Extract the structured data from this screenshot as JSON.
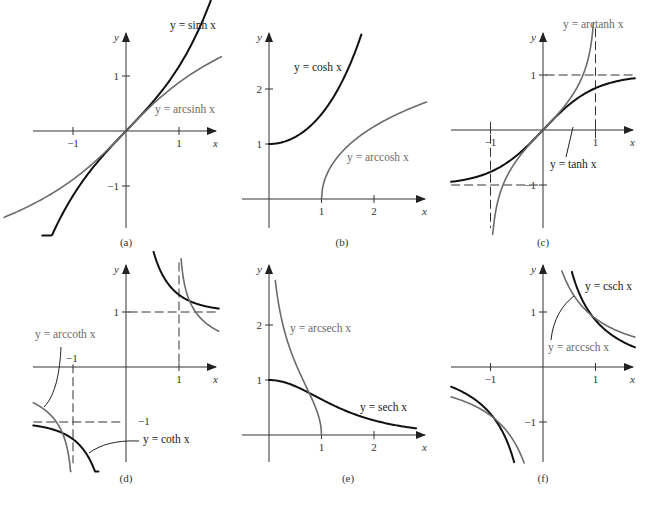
{
  "figure": {
    "panels": [
      {
        "id": "a",
        "caption": "(a)",
        "origin": [
          126,
          131
        ],
        "sx": 53,
        "sy": 55,
        "xaxis": [
          33,
          216
        ],
        "yaxis": [
          33,
          228
        ],
        "xlabel": "x",
        "ylabel": "y",
        "xticks": [
          {
            "v": -1,
            "label": "−1"
          },
          {
            "v": 1,
            "label": "1"
          }
        ],
        "yticks": [
          {
            "v": 1,
            "label": "1"
          },
          {
            "v": -1,
            "label": "−1"
          }
        ],
        "dashes": [],
        "curves": [
          {
            "name": "sinh",
            "fn": "sinh",
            "style": "fn",
            "domain": [
              -1.58,
              1.6
            ]
          },
          {
            "name": "arcsinh",
            "fn": "asinh",
            "style": "inv",
            "domain": [
              -2.3,
              1.8
            ]
          }
        ],
        "labels": [
          {
            "text": "y = sinh x",
            "x": 170,
            "y": 29,
            "style": "fn-label"
          },
          {
            "text": "y = arcsinh x",
            "x": 155,
            "y": 113,
            "style": "inv-label"
          }
        ],
        "leaders": [],
        "caption_pos": [
          126,
          246
        ]
      },
      {
        "id": "b",
        "caption": "(b)",
        "origin": [
          269,
          199
        ],
        "sx": 52.5,
        "sy": 55,
        "xaxis": [
          242,
          425
        ],
        "yaxis": [
          33,
          228
        ],
        "xlabel": "x",
        "ylabel": "y",
        "xticks": [
          {
            "v": 1,
            "label": "1"
          },
          {
            "v": 2,
            "label": "2"
          }
        ],
        "yticks": [
          {
            "v": 1,
            "label": "1"
          },
          {
            "v": 2,
            "label": "2"
          }
        ],
        "dashes": [],
        "curves": [
          {
            "name": "cosh",
            "fn": "cosh",
            "style": "fn",
            "domain": [
              0,
              1.76
            ]
          },
          {
            "name": "arccosh",
            "fn": "acosh",
            "style": "inv",
            "domain": [
              1,
              3.0
            ]
          }
        ],
        "labels": [
          {
            "text": "y = cosh x",
            "x": 294,
            "y": 71,
            "style": "fn-label"
          },
          {
            "text": "y = arccosh x",
            "x": 347,
            "y": 161,
            "style": "inv-label"
          }
        ],
        "leaders": [],
        "caption_pos": [
          342,
          246
        ]
      },
      {
        "id": "c",
        "caption": "(c)",
        "origin": [
          543,
          130
        ],
        "sx": 52.5,
        "sy": 55,
        "xaxis": [
          451,
          633
        ],
        "yaxis": [
          33,
          228
        ],
        "xlabel": "x",
        "ylabel": "y",
        "xticks": [
          {
            "v": -1,
            "label": "−1"
          },
          {
            "v": 1,
            "label": "1"
          }
        ],
        "yticks": [
          {
            "v": 1,
            "label": "1"
          },
          {
            "v": -1,
            "label": "−1"
          }
        ],
        "dashes": [
          {
            "x1": 1,
            "y1": 1.85,
            "x2": 1,
            "y2": -0.15
          },
          {
            "x1": -1,
            "y1": 0.15,
            "x2": -1,
            "y2": -1.78
          },
          {
            "x1": 0.05,
            "y1": 1,
            "x2": 1.75,
            "y2": 1
          },
          {
            "x1": -1.75,
            "y1": -1,
            "x2": -0.05,
            "y2": -1
          }
        ],
        "curves": [
          {
            "name": "tanh",
            "fn": "tanh",
            "style": "fn",
            "domain": [
              -1.75,
              1.75
            ]
          },
          {
            "name": "arctanh",
            "fn": "atanh",
            "style": "inv",
            "domain": [
              -0.96,
              0.96
            ]
          }
        ],
        "labels": [
          {
            "text": "y = arctanh x",
            "x": 563,
            "y": 28,
            "style": "inv-label"
          },
          {
            "text": "y = tanh x",
            "x": 550,
            "y": 168,
            "style": "fn-label"
          }
        ],
        "leaders": [
          {
            "x1": 566,
            "y1": 157,
            "x2": 573,
            "y2": 127
          }
        ],
        "caption_pos": [
          543,
          246
        ]
      },
      {
        "id": "d",
        "caption": "(d)",
        "origin": [
          126,
          367
        ],
        "sx": 53,
        "sy": 55,
        "xaxis": [
          33,
          216
        ],
        "yaxis": [
          265,
          462
        ],
        "xlabel": "x",
        "ylabel": "y",
        "xticks": [
          {
            "v": 1,
            "label": "1"
          }
        ],
        "yticks": [
          {
            "v": 1,
            "label": "1"
          }
        ],
        "extra_labels": [
          {
            "text": "−1",
            "x": 66,
            "y": 362
          },
          {
            "text": "−1",
            "x": 138,
            "y": 425
          }
        ],
        "dashes": [
          {
            "x1": 1,
            "y1": 1.9,
            "x2": 1,
            "y2": 0.05
          },
          {
            "x1": -1,
            "y1": 0.05,
            "x2": -1,
            "y2": -1.75
          },
          {
            "x1": 0.05,
            "y1": 1,
            "x2": 1.72,
            "y2": 1
          },
          {
            "x1": -1.75,
            "y1": -1,
            "x2": -0.05,
            "y2": -1
          }
        ],
        "curves": [
          {
            "name": "coth_pos",
            "fn": "coth",
            "style": "fn",
            "domain": [
              0.52,
              1.75
            ]
          },
          {
            "name": "coth_neg",
            "fn": "coth",
            "style": "fn",
            "domain": [
              -1.75,
              -0.52
            ]
          },
          {
            "name": "arccoth_pos",
            "fn": "acoth",
            "style": "inv",
            "domain": [
              1.04,
              1.75
            ]
          },
          {
            "name": "arccoth_neg",
            "fn": "acoth",
            "style": "inv",
            "domain": [
              -1.75,
              -1.04
            ]
          }
        ],
        "labels": [
          {
            "text": "y = arccoth x",
            "x": 35,
            "y": 338,
            "style": "inv-label"
          },
          {
            "text": "y = coth x",
            "x": 143,
            "y": 443,
            "style": "fn-label"
          }
        ],
        "leaders": [
          {
            "path": "M 61 347 C 60 370, 56 395, 44 407"
          },
          {
            "path": "M 139 441 C 115 440, 100 445, 89 453"
          }
        ],
        "caption_pos": [
          126,
          482
        ]
      },
      {
        "id": "e",
        "caption": "(e)",
        "origin": [
          269,
          435
        ],
        "sx": 52.5,
        "sy": 55,
        "xaxis": [
          242,
          425
        ],
        "yaxis": [
          265,
          462
        ],
        "xlabel": "x",
        "ylabel": "y",
        "xticks": [
          {
            "v": 1,
            "label": "1"
          },
          {
            "v": 2,
            "label": "2"
          }
        ],
        "yticks": [
          {
            "v": 1,
            "label": "1"
          },
          {
            "v": 2,
            "label": "2"
          }
        ],
        "dashes": [],
        "curves": [
          {
            "name": "sech",
            "fn": "sech",
            "style": "fn",
            "domain": [
              0,
              2.8
            ]
          },
          {
            "name": "arcsech",
            "fn": "asech",
            "style": "inv",
            "domain": [
              0.12,
              1.0
            ]
          }
        ],
        "labels": [
          {
            "text": "y = arcsech x",
            "x": 290,
            "y": 332,
            "style": "inv-label"
          },
          {
            "text": "y = sech x",
            "x": 360,
            "y": 411,
            "style": "fn-label"
          }
        ],
        "leaders": [],
        "caption_pos": [
          348,
          482
        ]
      },
      {
        "id": "f",
        "caption": "(f)",
        "origin": [
          543,
          367
        ],
        "sx": 52.5,
        "sy": 55,
        "xaxis": [
          451,
          633
        ],
        "yaxis": [
          265,
          462
        ],
        "xlabel": "x",
        "ylabel": "y",
        "xticks": [
          {
            "v": -1,
            "label": "−1"
          },
          {
            "v": 1,
            "label": "1"
          }
        ],
        "yticks": [
          {
            "v": 1,
            "label": "1"
          },
          {
            "v": -1,
            "label": "−1"
          }
        ],
        "dashes": [],
        "curves": [
          {
            "name": "csch_pos",
            "fn": "csch",
            "style": "fn",
            "domain": [
              0.55,
              1.75
            ]
          },
          {
            "name": "csch_neg",
            "fn": "csch",
            "style": "fn",
            "domain": [
              -1.75,
              -0.55
            ]
          },
          {
            "name": "arccsch_pos",
            "fn": "acsch",
            "style": "inv",
            "domain": [
              0.36,
              1.75
            ]
          },
          {
            "name": "arccsch_neg",
            "fn": "acsch",
            "style": "inv",
            "domain": [
              -1.75,
              -0.36
            ]
          }
        ],
        "labels": [
          {
            "text": "y = csch x",
            "x": 585,
            "y": 290,
            "style": "fn-label"
          },
          {
            "text": "y = arccsch x",
            "x": 548,
            "y": 351,
            "style": "inv-label"
          }
        ],
        "leaders": [
          {
            "path": "M 551 340 C 553 320, 562 305, 574 296"
          }
        ],
        "caption_pos": [
          543,
          482
        ]
      }
    ]
  },
  "chart_data": [
    {
      "type": "line",
      "title": "(a)",
      "xlabel": "x",
      "ylabel": "y",
      "xlim": [
        -1.75,
        1.7
      ],
      "ylim": [
        -1.75,
        1.75
      ],
      "grid": false,
      "xticks": [
        -1,
        1
      ],
      "yticks": [
        -1,
        1
      ],
      "series": [
        {
          "name": "y = sinh x",
          "x": [
            -1.5,
            -1,
            -0.5,
            0,
            0.5,
            1,
            1.5
          ],
          "values": [
            -2.13,
            -1.18,
            -0.52,
            0,
            0.52,
            1.18,
            2.13
          ]
        },
        {
          "name": "y = arcsinh x",
          "x": [
            -1.5,
            -1,
            -0.5,
            0,
            0.5,
            1,
            1.5
          ],
          "values": [
            -1.19,
            -0.88,
            -0.48,
            0,
            0.48,
            0.88,
            1.19
          ]
        }
      ]
    },
    {
      "type": "line",
      "title": "(b)",
      "xlabel": "x",
      "ylabel": "y",
      "xlim": [
        -0.5,
        2.9
      ],
      "ylim": [
        -0.5,
        3.0
      ],
      "grid": false,
      "xticks": [
        1,
        2
      ],
      "yticks": [
        1,
        2
      ],
      "series": [
        {
          "name": "y = cosh x",
          "x": [
            0,
            0.5,
            1,
            1.5,
            1.75
          ],
          "values": [
            1,
            1.13,
            1.54,
            2.35,
            2.96
          ]
        },
        {
          "name": "y = arccosh x",
          "x": [
            1,
            1.5,
            2,
            2.5,
            3
          ],
          "values": [
            0,
            0.96,
            1.32,
            1.57,
            1.76
          ]
        }
      ]
    },
    {
      "type": "line",
      "title": "(c)",
      "xlabel": "x",
      "ylabel": "y",
      "xlim": [
        -1.75,
        1.75
      ],
      "ylim": [
        -1.75,
        1.75
      ],
      "grid": false,
      "xticks": [
        -1,
        1
      ],
      "yticks": [
        -1,
        1
      ],
      "asymptotes": {
        "x": [
          -1,
          1
        ],
        "y": [
          -1,
          1
        ]
      },
      "series": [
        {
          "name": "y = tanh x",
          "x": [
            -1.5,
            -1,
            -0.5,
            0,
            0.5,
            1,
            1.5
          ],
          "values": [
            -0.91,
            -0.76,
            -0.46,
            0,
            0.46,
            0.76,
            0.91
          ]
        },
        {
          "name": "y = arctanh x",
          "x": [
            -0.95,
            -0.75,
            -0.5,
            0,
            0.5,
            0.75,
            0.95
          ],
          "values": [
            -1.83,
            -0.97,
            -0.55,
            0,
            0.55,
            0.97,
            1.83
          ]
        }
      ]
    },
    {
      "type": "line",
      "title": "(d)",
      "xlabel": "x",
      "ylabel": "y",
      "xlim": [
        -1.75,
        1.7
      ],
      "ylim": [
        -1.75,
        1.85
      ],
      "grid": false,
      "xticks": [
        -1,
        1
      ],
      "yticks": [
        -1,
        1
      ],
      "asymptotes": {
        "x": [
          -1,
          1
        ],
        "y": [
          -1,
          1
        ]
      },
      "series": [
        {
          "name": "y = coth x",
          "x": [
            -1.75,
            -1,
            -0.55,
            0.55,
            1,
            1.75
          ],
          "values": [
            -1.06,
            -1.31,
            -2.0,
            2.0,
            1.31,
            1.06
          ]
        },
        {
          "name": "y = arccoth x",
          "x": [
            -1.75,
            -1.25,
            -1.05,
            1.05,
            1.25,
            1.75
          ],
          "values": [
            -0.65,
            -1.1,
            -1.84,
            1.84,
            1.1,
            0.65
          ]
        }
      ]
    },
    {
      "type": "line",
      "title": "(e)",
      "xlabel": "x",
      "ylabel": "y",
      "xlim": [
        -0.5,
        2.9
      ],
      "ylim": [
        -0.5,
        3.0
      ],
      "grid": false,
      "xticks": [
        1,
        2
      ],
      "yticks": [
        1,
        2
      ],
      "series": [
        {
          "name": "y = sech x",
          "x": [
            0,
            0.5,
            1,
            1.5,
            2,
            2.5,
            2.8
          ],
          "values": [
            1,
            0.89,
            0.65,
            0.43,
            0.27,
            0.16,
            0.12
          ]
        },
        {
          "name": "y = arcsech x",
          "x": [
            0.12,
            0.25,
            0.5,
            0.75,
            0.9,
            1
          ],
          "values": [
            2.81,
            2.06,
            1.32,
            0.8,
            0.47,
            0
          ]
        }
      ]
    },
    {
      "type": "line",
      "title": "(f)",
      "xlabel": "x",
      "ylabel": "y",
      "xlim": [
        -1.75,
        1.75
      ],
      "ylim": [
        -1.75,
        1.85
      ],
      "grid": false,
      "xticks": [
        -1,
        1
      ],
      "yticks": [
        -1,
        1
      ],
      "series": [
        {
          "name": "y = csch x",
          "x": [
            -1.75,
            -1,
            -0.6,
            0.6,
            1,
            1.75
          ],
          "values": [
            -0.36,
            -0.85,
            -1.57,
            1.57,
            0.85,
            0.36
          ]
        },
        {
          "name": "y = arccsch x",
          "x": [
            -1.75,
            -1,
            -0.6,
            0.6,
            1,
            1.75
          ],
          "values": [
            -0.54,
            -0.88,
            -1.28,
            1.28,
            0.88,
            0.54
          ]
        }
      ]
    }
  ]
}
